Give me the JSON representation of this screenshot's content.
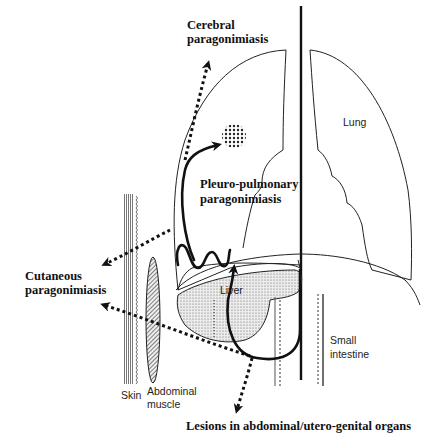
{
  "diagram": {
    "labels": {
      "cerebral_line1": "Cerebral",
      "cerebral_line2": "paragonimiasis",
      "lung": "Lung",
      "pleuro_line1": "Pleuro-pulmonary",
      "pleuro_line2": "paragonimiasis",
      "cutaneous_line1": "Cutaneous",
      "cutaneous_line2": "paragonimiasis",
      "liver": "Liver",
      "small_intestine_line1": "Small",
      "small_intestine_line2": "intestine",
      "skin": "Skin",
      "abdominal_muscle_line1": "Abdominal",
      "abdominal_muscle_line2": "muscle",
      "lesions": "Lesions in abdominal/utero-genital organs"
    },
    "structures": [
      "left-lung",
      "right-lung",
      "diaphragm",
      "liver",
      "small-intestine",
      "skin",
      "abdominal-muscle",
      "brain-lesion-cyst",
      "midline-mediastinum"
    ],
    "migration_paths": [
      {
        "name": "cerebral",
        "style": "dotted",
        "direction": "up"
      },
      {
        "name": "pleuro-pulmonary",
        "style": "solid",
        "direction": "up-into-lung"
      },
      {
        "name": "cutaneous-upper",
        "style": "dotted",
        "direction": "left"
      },
      {
        "name": "cutaneous-lower",
        "style": "dotted",
        "direction": "left"
      },
      {
        "name": "abdominal-utero-genital",
        "style": "dotted",
        "direction": "down"
      }
    ],
    "colors": {
      "line": "#111111",
      "stipple_fill": "#d9d9d9",
      "background": "#ffffff"
    }
  }
}
